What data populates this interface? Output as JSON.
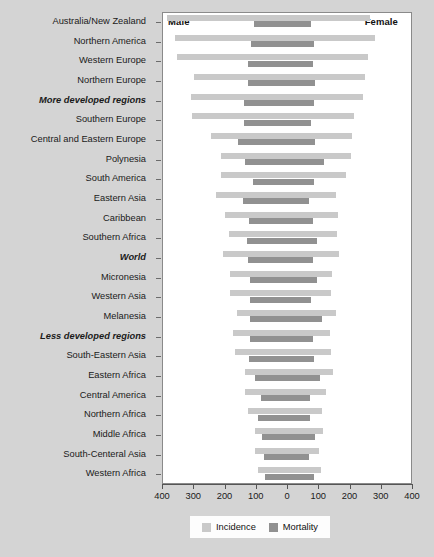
{
  "headers": {
    "left": "Male",
    "right": "Female"
  },
  "legend": {
    "incidence_label": "Incidence",
    "mortality_label": "Mortality",
    "incidence_color": "#c9c9c9",
    "mortality_color": "#919191"
  },
  "axis": {
    "ticks": [
      "400",
      "300",
      "200",
      "100",
      "0",
      "100",
      "200",
      "300",
      "400"
    ],
    "max": 400
  },
  "chart_data": {
    "type": "bar",
    "orientation": "horizontal-diverging",
    "title": "",
    "subtitle": "",
    "xlabel": "",
    "ylabel": "",
    "xlim": [
      -400,
      400
    ],
    "grid": false,
    "legend_position": "bottom-center",
    "left_side": "Male",
    "right_side": "Female",
    "series": [
      {
        "name": "Incidence",
        "color": "#c9c9c9"
      },
      {
        "name": "Mortality",
        "color": "#919191"
      }
    ],
    "categories": [
      "Australia/New Zealand",
      "Northern America",
      "Western Europe",
      "Northern Europe",
      "More developed regions",
      "Southern Europe",
      "Central and Eastern Europe",
      "Polynesia",
      "South America",
      "Eastern Asia",
      "Caribbean",
      "Southern Africa",
      "World",
      "Micronesia",
      "Western Asia",
      "Melanesia",
      "Less developed regions",
      "South-Eastern Asia",
      "Eastern Africa",
      "Central America",
      "Northern Africa",
      "Middle Africa",
      "South-Centeral Asia",
      "Western Africa"
    ],
    "emphasized_categories": [
      "More developed regions",
      "World",
      "Less developed regions"
    ],
    "data": [
      {
        "category": "Australia/New Zealand",
        "male_incidence": 385,
        "male_mortality": 106,
        "female_incidence": 265,
        "female_mortality": 76
      },
      {
        "category": "Northern America",
        "male_incidence": 360,
        "male_mortality": 116,
        "female_incidence": 280,
        "female_mortality": 85
      },
      {
        "category": "Western Europe",
        "male_incidence": 353,
        "male_mortality": 125,
        "female_incidence": 258,
        "female_mortality": 83
      },
      {
        "category": "Northern Europe",
        "male_incidence": 298,
        "male_mortality": 126,
        "female_incidence": 249,
        "female_mortality": 89
      },
      {
        "category": "More developed regions",
        "male_incidence": 307,
        "male_mortality": 139,
        "female_incidence": 242,
        "female_mortality": 86
      },
      {
        "category": "Southern Europe",
        "male_incidence": 304,
        "male_mortality": 139,
        "female_incidence": 215,
        "female_mortality": 76
      },
      {
        "category": "Central and Eastern Europe",
        "male_incidence": 244,
        "male_mortality": 156,
        "female_incidence": 208,
        "female_mortality": 90
      },
      {
        "category": "Polynesia",
        "male_incidence": 210,
        "male_mortality": 136,
        "female_incidence": 206,
        "female_mortality": 119
      },
      {
        "category": "South America",
        "male_incidence": 212,
        "male_mortality": 108,
        "female_incidence": 188,
        "female_mortality": 85
      },
      {
        "category": "Eastern Asia",
        "male_incidence": 227,
        "male_mortality": 140,
        "female_incidence": 158,
        "female_mortality": 71
      },
      {
        "category": "Caribbean",
        "male_incidence": 198,
        "male_mortality": 122,
        "female_incidence": 162,
        "female_mortality": 83
      },
      {
        "category": "Southern Africa",
        "male_incidence": 187,
        "male_mortality": 127,
        "female_incidence": 159,
        "female_mortality": 96
      },
      {
        "category": "World",
        "male_incidence": 205,
        "male_mortality": 126,
        "female_incidence": 165,
        "female_mortality": 83
      },
      {
        "category": "Micronesia",
        "male_incidence": 181,
        "male_mortality": 119,
        "female_incidence": 144,
        "female_mortality": 96
      },
      {
        "category": "Western Asia",
        "male_incidence": 184,
        "male_mortality": 117,
        "female_incidence": 140,
        "female_mortality": 77
      },
      {
        "category": "Melanesia",
        "male_incidence": 161,
        "male_mortality": 120,
        "female_incidence": 157,
        "female_mortality": 111
      },
      {
        "category": "Less developed regions",
        "male_incidence": 172,
        "male_mortality": 119,
        "female_incidence": 136,
        "female_mortality": 83
      },
      {
        "category": "South-Eastern Asia",
        "male_incidence": 167,
        "male_mortality": 122,
        "female_incidence": 140,
        "female_mortality": 86
      },
      {
        "category": "Eastern Africa",
        "male_incidence": 134,
        "male_mortality": 104,
        "female_incidence": 147,
        "female_mortality": 105
      },
      {
        "category": "Central America",
        "male_incidence": 133,
        "male_mortality": 83,
        "female_incidence": 125,
        "female_mortality": 73
      },
      {
        "category": "Northern Africa",
        "male_incidence": 124,
        "male_mortality": 92,
        "female_incidence": 113,
        "female_mortality": 74
      },
      {
        "category": "Middle Africa",
        "male_incidence": 101,
        "male_mortality": 80,
        "female_incidence": 116,
        "female_mortality": 88
      },
      {
        "category": "South-Centeral Asia",
        "male_incidence": 102,
        "male_mortality": 75,
        "female_incidence": 103,
        "female_mortality": 70
      },
      {
        "category": "Western Africa",
        "male_incidence": 93,
        "male_mortality": 72,
        "female_incidence": 110,
        "female_mortality": 86
      }
    ]
  }
}
